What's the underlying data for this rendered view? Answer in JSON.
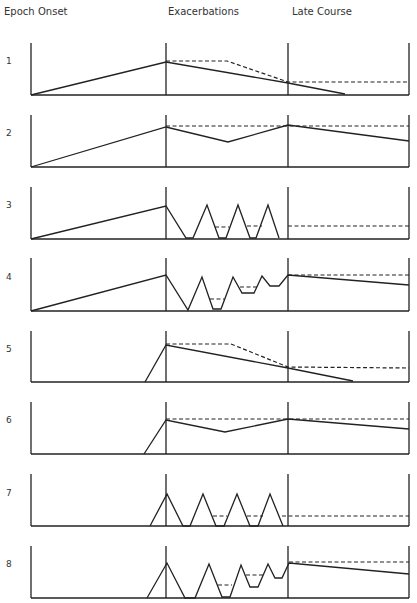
{
  "header": {
    "epoch": "Epoch",
    "onset": "Onset",
    "exacerbations": "Exacerbations",
    "late_course": "Late Course"
  },
  "layout": {
    "left_x": 31,
    "onset_end_x": 166,
    "exac_end_x": 288,
    "right_x": 409
  },
  "epochs": [
    {
      "label": "1",
      "top": 43,
      "base": 95,
      "label_y": 62,
      "solid": [
        [
          31,
          95
        ],
        [
          166,
          62
        ],
        [
          288,
          83
        ],
        [
          345,
          94
        ]
      ],
      "dashed": [
        [
          [
            166,
            61
          ],
          [
            227,
            61
          ],
          [
            288,
            82
          ],
          [
            409,
            82
          ]
        ]
      ]
    },
    {
      "label": "2",
      "top": 115,
      "base": 167,
      "label_y": 134,
      "solid": [
        [
          31,
          167
        ],
        [
          166,
          127
        ],
        [
          228,
          142
        ],
        [
          288,
          125
        ],
        [
          409,
          141
        ]
      ],
      "dashed": [
        [
          [
            166,
            126
          ],
          [
            409,
            126
          ]
        ]
      ]
    },
    {
      "label": "3",
      "top": 187,
      "base": 239,
      "label_y": 206,
      "solid": [
        [
          31,
          239
        ],
        [
          166,
          206
        ],
        [
          186,
          238
        ],
        [
          193,
          238
        ],
        [
          207,
          205
        ],
        [
          219,
          238
        ],
        [
          226,
          238
        ],
        [
          238,
          205
        ],
        [
          250,
          238
        ],
        [
          256,
          238
        ],
        [
          268,
          205
        ],
        [
          279,
          238
        ]
      ],
      "dashed": [
        [
          [
            215,
            227
          ],
          [
            229,
            227
          ]
        ],
        [
          [
            247,
            226
          ],
          [
            262,
            226
          ]
        ],
        [
          [
            288,
            226
          ],
          [
            409,
            226
          ]
        ]
      ]
    },
    {
      "label": "4",
      "top": 258,
      "base": 311,
      "label_y": 278,
      "solid": [
        [
          31,
          311
        ],
        [
          166,
          275
        ],
        [
          188,
          310
        ],
        [
          202,
          277
        ],
        [
          213,
          309
        ],
        [
          221,
          309
        ],
        [
          233,
          277
        ],
        [
          242,
          293
        ],
        [
          254,
          293
        ],
        [
          262,
          276
        ],
        [
          270,
          286
        ],
        [
          279,
          286
        ],
        [
          288,
          275
        ],
        [
          409,
          285
        ]
      ],
      "dashed": [
        [
          [
            210,
            299
          ],
          [
            224,
            299
          ]
        ],
        [
          [
            240,
            287
          ],
          [
            259,
            287
          ]
        ],
        [
          [
            288,
            275
          ],
          [
            409,
            275
          ]
        ]
      ]
    },
    {
      "label": "5",
      "top": 331,
      "base": 382,
      "label_y": 350,
      "solid": [
        [
          145,
          382
        ],
        [
          166,
          345
        ],
        [
          288,
          368
        ],
        [
          353,
          381
        ]
      ],
      "dashed": [
        [
          [
            166,
            344
          ],
          [
            231,
            344
          ],
          [
            288,
            367
          ],
          [
            409,
            368
          ]
        ]
      ]
    },
    {
      "label": "6",
      "top": 402,
      "base": 454,
      "label_y": 421,
      "solid": [
        [
          144,
          454
        ],
        [
          166,
          420
        ],
        [
          225,
          432
        ],
        [
          288,
          419
        ],
        [
          409,
          429
        ]
      ],
      "dashed": [
        [
          [
            166,
            419
          ],
          [
            409,
            419
          ]
        ]
      ]
    },
    {
      "label": "7",
      "top": 474,
      "base": 526,
      "label_y": 494,
      "solid": [
        [
          150,
          526
        ],
        [
          167,
          494
        ],
        [
          183,
          526
        ],
        [
          190,
          526
        ],
        [
          203,
          494
        ],
        [
          216,
          526
        ],
        [
          224,
          526
        ],
        [
          237,
          494
        ],
        [
          250,
          526
        ],
        [
          258,
          526
        ],
        [
          270,
          494
        ],
        [
          283,
          526
        ]
      ],
      "dashed": [
        [
          [
            213,
            516
          ],
          [
            227,
            516
          ]
        ],
        [
          [
            247,
            516
          ],
          [
            263,
            516
          ]
        ],
        [
          [
            282,
            516
          ],
          [
            409,
            516
          ]
        ]
      ]
    },
    {
      "label": "8",
      "top": 546,
      "base": 598,
      "label_y": 565,
      "solid": [
        [
          147,
          598
        ],
        [
          167,
          563
        ],
        [
          185,
          598
        ],
        [
          195,
          598
        ],
        [
          209,
          564
        ],
        [
          222,
          597
        ],
        [
          230,
          597
        ],
        [
          241,
          565
        ],
        [
          250,
          587
        ],
        [
          258,
          587
        ],
        [
          268,
          564
        ],
        [
          275,
          578
        ],
        [
          282,
          578
        ],
        [
          289,
          563
        ],
        [
          409,
          574
        ]
      ],
      "dashed": [
        [
          [
            218,
            585
          ],
          [
            232,
            585
          ]
        ],
        [
          [
            246,
            575
          ],
          [
            264,
            575
          ]
        ],
        [
          [
            289,
            562
          ],
          [
            409,
            562
          ]
        ]
      ]
    }
  ]
}
